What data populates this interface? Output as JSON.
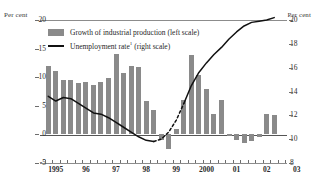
{
  "chart_data": {
    "type": "bar",
    "title": "",
    "xlabel": "",
    "ylabel": "Per cent",
    "y2label": "Per cent",
    "ylim": [
      -5,
      20
    ],
    "y2lim": [
      8,
      20
    ],
    "grid": false,
    "legend_position": "top-left",
    "left_axis": {
      "label": "Per cent",
      "ticks": [
        "20",
        "15",
        "10",
        "5",
        "0",
        "-5"
      ],
      "values": [
        20,
        15,
        10,
        5,
        0,
        -5
      ]
    },
    "right_axis": {
      "label": "Per cent",
      "ticks": [
        "20",
        "18",
        "16",
        "14",
        "12",
        "10",
        "8"
      ],
      "values": [
        20,
        18,
        16,
        14,
        12,
        10,
        8
      ]
    },
    "x_tick_labels": [
      "1995",
      "96",
      "97",
      "98",
      "99",
      "2000",
      "01",
      "02",
      "03"
    ],
    "x_tick_values": [
      1995,
      1996,
      1997,
      1998,
      1999,
      2000,
      2001,
      2002,
      2003
    ],
    "x_minor_tick_interval": 0.25,
    "series": [
      {
        "name": "Growth of industrial production (left scale)",
        "type": "bar",
        "axis": "left",
        "color": "#8a8a8a",
        "x": [
          1995.0,
          1995.25,
          1995.5,
          1995.75,
          1996.0,
          1996.25,
          1996.5,
          1996.75,
          1997.0,
          1997.25,
          1997.5,
          1997.75,
          1998.0,
          1998.25,
          1998.5,
          1998.75,
          1999.0,
          1999.25,
          1999.5,
          1999.75,
          2000.0,
          2000.25,
          2000.5,
          2000.75,
          2001.0,
          2001.25,
          2001.5,
          2001.75,
          2002.0,
          2002.25,
          2002.5
        ],
        "values": [
          12.0,
          11.1,
          9.5,
          9.5,
          9.0,
          9.1,
          8.7,
          9.2,
          9.8,
          14.0,
          10.8,
          11.9,
          11.7,
          5.9,
          4.2,
          -0.9,
          -2.6,
          1.0,
          6.0,
          13.8,
          10.3,
          8.0,
          3.5,
          6.1,
          -0.3,
          -1.0,
          -1.5,
          -1.1,
          -0.4,
          3.5,
          3.4
        ]
      },
      {
        "name": "Unemployment rate¹ (right scale)",
        "type": "line",
        "axis": "right",
        "color": "#111111",
        "x": [
          1995.0,
          1995.25,
          1995.5,
          1995.75,
          1996.0,
          1996.25,
          1996.5,
          1996.75,
          1997.0,
          1997.25,
          1997.5,
          1997.75,
          1998.0,
          1998.25,
          1998.5,
          1998.75,
          1999.0,
          1999.25,
          1999.5,
          1999.75,
          2000.0,
          2000.25,
          2000.5,
          2000.75,
          2001.0,
          2001.25,
          2001.5,
          2001.75,
          2002.0,
          2002.25,
          2002.5
        ],
        "values": [
          13.6,
          13.2,
          13.5,
          13.4,
          13.0,
          12.6,
          12.2,
          12.1,
          11.8,
          11.4,
          11.0,
          10.6,
          10.2,
          9.9,
          9.8,
          10.0,
          10.6,
          11.6,
          13.0,
          14.5,
          15.6,
          16.4,
          17.1,
          17.7,
          18.4,
          19.0,
          19.5,
          19.8,
          19.9,
          20.0,
          20.2
        ],
        "dashed_segment": {
          "from_x": 1998.5,
          "to_x": 1999.5,
          "note": "interpolated / break in series"
        }
      }
    ]
  },
  "legend": {
    "items": [
      {
        "label": "Growth of industrial production (left scale)",
        "marker": "bar-swatch"
      },
      {
        "label": "Unemployment rate",
        "superscript": "1",
        "suffix": " (right scale)",
        "marker": "line-swatch"
      }
    ]
  }
}
